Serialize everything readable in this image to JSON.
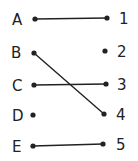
{
  "diagram": {
    "type": "matching",
    "left_items": [
      {
        "label": "A",
        "x": 35,
        "y": 19,
        "lx": 12,
        "ly": 25
      },
      {
        "label": "B",
        "x": 34,
        "y": 53,
        "lx": 11,
        "ly": 58
      },
      {
        "label": "C",
        "x": 34,
        "y": 85,
        "lx": 12,
        "ly": 91
      },
      {
        "label": "D",
        "x": 33,
        "y": 115,
        "lx": 12,
        "ly": 121
      },
      {
        "label": "E",
        "x": 33,
        "y": 146,
        "lx": 12,
        "ly": 152
      }
    ],
    "right_items": [
      {
        "label": "1",
        "x": 107,
        "y": 18,
        "lx": 119,
        "ly": 24
      },
      {
        "label": "2",
        "x": 105,
        "y": 51,
        "lx": 117,
        "ly": 57
      },
      {
        "label": "3",
        "x": 106,
        "y": 84,
        "lx": 117,
        "ly": 90
      },
      {
        "label": "4",
        "x": 104,
        "y": 114,
        "lx": 116,
        "ly": 120
      },
      {
        "label": "5",
        "x": 103,
        "y": 144,
        "lx": 116,
        "ly": 150
      }
    ],
    "connections": [
      {
        "from": "A",
        "to": "1"
      },
      {
        "from": "B",
        "to": "4"
      },
      {
        "from": "C",
        "to": "3"
      },
      {
        "from": "E",
        "to": "5"
      }
    ],
    "colors": {
      "ink": "#222222",
      "background": "#ffffff"
    }
  }
}
